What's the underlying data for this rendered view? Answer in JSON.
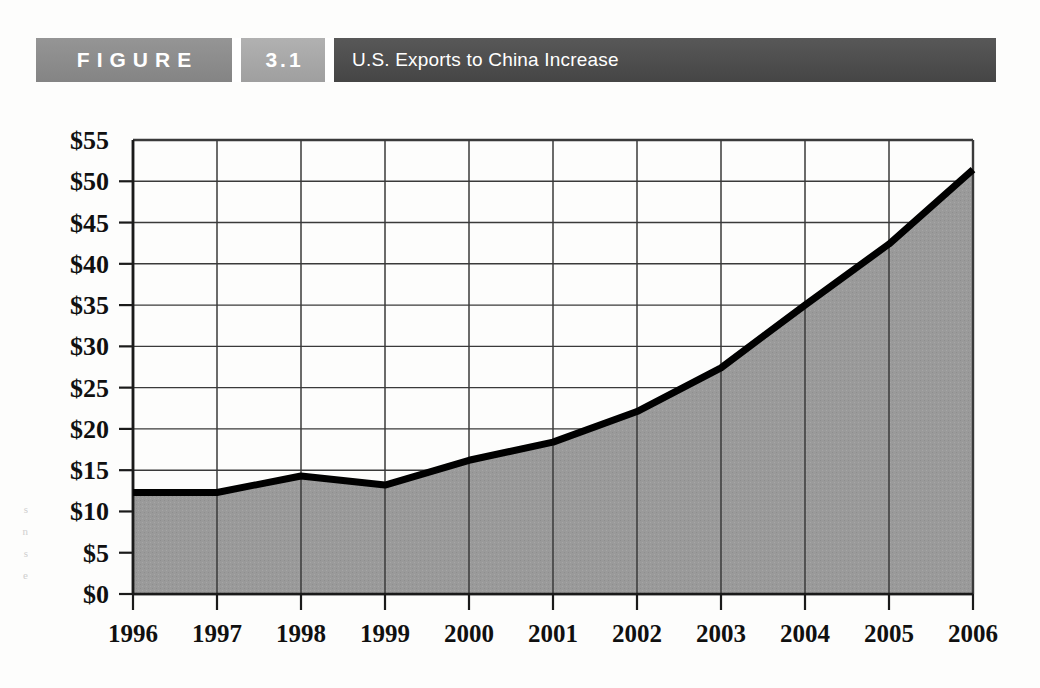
{
  "banner": {
    "figure_word": "FIGURE",
    "figure_number": "3.1",
    "title": "U.S. Exports to China Increase",
    "figure_word_bg": "#8c8c8c",
    "figure_number_bg": "#a8a8a8",
    "title_bg": "#4d4d4d",
    "text_color": "#ffffff"
  },
  "chart_data": {
    "type": "area",
    "title": "U.S. Exports to China Increase",
    "subtitle": "",
    "xlabel": "",
    "ylabel": "",
    "categories": [
      "1996",
      "1997",
      "1998",
      "1999",
      "2000",
      "2001",
      "2002",
      "2003",
      "2004",
      "2005",
      "2006"
    ],
    "values": [
      12.3,
      12.3,
      14.3,
      13.2,
      16.2,
      18.4,
      22.1,
      27.4,
      35.0,
      42.4,
      51.4
    ],
    "series": [
      {
        "name": "U.S. Exports to China",
        "values": [
          12.3,
          12.3,
          14.3,
          13.2,
          16.2,
          18.4,
          22.1,
          27.4,
          35.0,
          42.4,
          51.4
        ]
      }
    ],
    "ylim": [
      0,
      55
    ],
    "ytick_values": [
      0,
      5,
      10,
      15,
      20,
      25,
      30,
      35,
      40,
      45,
      50,
      55
    ],
    "ytick_labels": [
      "$0",
      "$5",
      "$10",
      "$15",
      "$20",
      "$25",
      "$30",
      "$35",
      "$40",
      "$45",
      "$50",
      "$55"
    ],
    "xtick_labels": [
      "1996",
      "1997",
      "1998",
      "1999",
      "2000",
      "2001",
      "2002",
      "2003",
      "2004",
      "2005",
      "2006"
    ],
    "grid": true,
    "grid_orientation": "horizontal-and-vertical",
    "legend": false,
    "legend_position": "none",
    "value_unit": "billions of dollars",
    "area_fill_color": "#9a9a9a",
    "line_color": "#000000",
    "grid_color": "#3a3a3a",
    "axis_color": "#1a1a1a",
    "plot_background": "#ffffff"
  },
  "margin_artifact": {
    "lines": [
      "s",
      "n",
      "s",
      "e"
    ]
  }
}
